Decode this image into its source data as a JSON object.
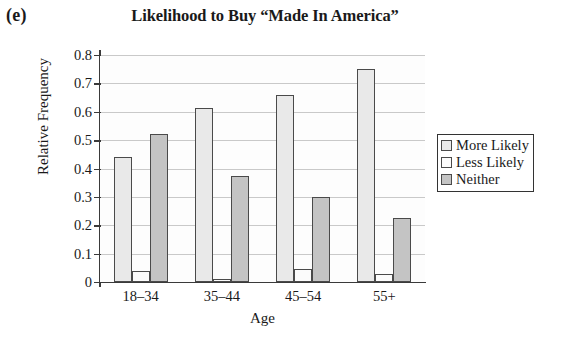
{
  "panel_label": "(e)",
  "chart_data": {
    "type": "bar",
    "title": "Likelihood to Buy “Made In America”",
    "xlabel": "Age",
    "ylabel": "Relative Frequency",
    "categories": [
      "18–34",
      "35–44",
      "45–54",
      "55+"
    ],
    "series": [
      {
        "name": "More Likely",
        "color": "#e9e9e9",
        "values": [
          0.44,
          0.615,
          0.66,
          0.75
        ]
      },
      {
        "name": "Less Likely",
        "color": "#fbfbfb",
        "values": [
          0.04,
          0.012,
          0.045,
          0.03
        ]
      },
      {
        "name": "Neither",
        "color": "#c4c4c4",
        "values": [
          0.52,
          0.375,
          0.3,
          0.225
        ]
      }
    ],
    "ylim": [
      0,
      0.8
    ],
    "ytick_labels": [
      "0.8",
      "0.7",
      "0.6",
      "0.5",
      "0.4",
      "0.3",
      "0.2",
      "0.1",
      "0"
    ],
    "ytick_values": [
      0.8,
      0.7,
      0.6,
      0.5,
      0.4,
      0.3,
      0.2,
      0.1,
      0
    ],
    "grid": true,
    "legend_position": "right"
  },
  "legend": {
    "items": [
      {
        "label": "More Likely",
        "swatch": "#e9e9e9"
      },
      {
        "label": "Less Likely",
        "swatch": "#fbfbfb"
      },
      {
        "label": "Neither",
        "swatch": "#c4c4c4"
      }
    ]
  }
}
